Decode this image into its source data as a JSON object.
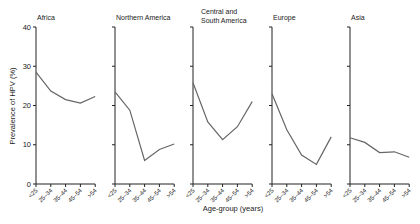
{
  "chart_data": {
    "type": "line",
    "title": "",
    "xlabel": "Age-group (years)",
    "ylabel": "Prevalence of HPV (%)",
    "ylim": [
      0,
      40
    ],
    "yticks": [
      0,
      10,
      20,
      30,
      40
    ],
    "categories": [
      "<25",
      "25–34",
      "35–44",
      "45–54",
      ">54"
    ],
    "grid": false,
    "legend": "none",
    "series": [
      {
        "name": "Africa",
        "values": [
          28.5,
          23.7,
          21.5,
          20.6,
          22.3
        ]
      },
      {
        "name": "Northern America",
        "values": [
          23.5,
          18.8,
          6.0,
          8.8,
          10.2
        ]
      },
      {
        "name": "Central and South America",
        "values": [
          25.8,
          15.8,
          11.3,
          14.6,
          21.0
        ]
      },
      {
        "name": "Europe",
        "values": [
          23.0,
          13.8,
          7.4,
          5.0,
          12.0
        ]
      },
      {
        "name": "Asia",
        "values": [
          11.8,
          10.6,
          8.0,
          8.2,
          6.8
        ]
      }
    ]
  },
  "panels": [
    {
      "title_lines": [
        "Africa"
      ]
    },
    {
      "title_lines": [
        "Northern America"
      ]
    },
    {
      "title_lines": [
        "Central and",
        "South America"
      ]
    },
    {
      "title_lines": [
        "Europe"
      ]
    },
    {
      "title_lines": [
        "Asia"
      ]
    }
  ],
  "colors": {
    "line": "#666666",
    "axis": "#222222",
    "watermark": "#f0f0f0"
  }
}
